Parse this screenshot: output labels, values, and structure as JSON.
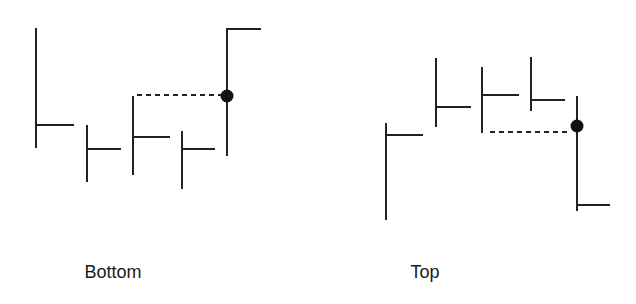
{
  "diagram": {
    "type": "price-bar pattern illustration",
    "stroke_color": "#222222",
    "panels": [
      {
        "id": "bottom",
        "label": "Bottom",
        "bars": [
          {
            "x": 36,
            "high": 28,
            "low": 148,
            "tick_y": 125,
            "tick_side": "right"
          },
          {
            "x": 87,
            "high": 125,
            "low": 182,
            "tick_y": 149,
            "tick_side": "right"
          },
          {
            "x": 133,
            "high": 96,
            "low": 175,
            "tick_y": 137,
            "tick_side": "right"
          },
          {
            "x": 182,
            "high": 131,
            "low": 189,
            "tick_y": 149,
            "tick_side": "right"
          },
          {
            "x": 227,
            "high": 28,
            "low": 156,
            "tick_y": 28,
            "tick_side": "right"
          }
        ],
        "marker": {
          "x": 227,
          "y": 96,
          "shape": "filled-circle"
        },
        "dashed_line": {
          "x1": 137,
          "x2": 221,
          "y": 95
        }
      },
      {
        "id": "top",
        "label": "Top",
        "bars": [
          {
            "x": 386,
            "high": 123,
            "low": 220,
            "tick_y": 135,
            "tick_side": "right"
          },
          {
            "x": 436,
            "high": 58,
            "low": 127,
            "tick_y": 107,
            "tick_side": "right"
          },
          {
            "x": 482,
            "high": 67,
            "low": 133,
            "tick_y": 95,
            "tick_side": "right"
          },
          {
            "x": 531,
            "high": 57,
            "low": 111,
            "tick_y": 100,
            "tick_side": "right"
          },
          {
            "x": 577,
            "high": 96,
            "low": 211,
            "tick_y": 205,
            "tick_side": "right"
          }
        ],
        "marker": {
          "x": 577,
          "y": 126,
          "shape": "filled-circle"
        },
        "dashed_line": {
          "x1": 490,
          "x2": 568,
          "y": 132
        }
      }
    ]
  },
  "labels": {
    "bottom": "Bottom",
    "top": "Top"
  }
}
